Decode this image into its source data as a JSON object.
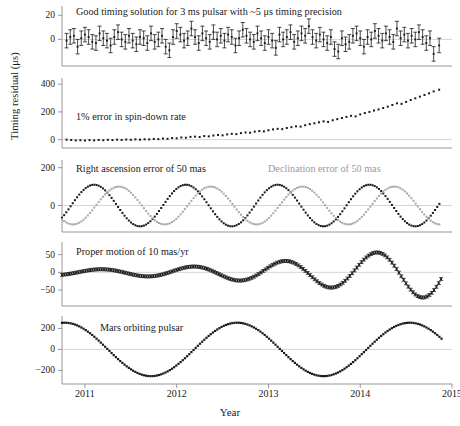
{
  "figure": {
    "ylabel": "Timing residual (μs)",
    "xlabel": "Year",
    "xticks": [
      "2011",
      "2012",
      "2013",
      "2014",
      "2015"
    ],
    "xlim": [
      2010.75,
      2015.0
    ],
    "series_color_black": "#1a1a1a",
    "series_color_gray": "#a8a8a8"
  },
  "chart_data": [
    {
      "type": "scatter",
      "panel": 1,
      "title": "Good timing solution for 3 ms pulsar with ~5 μs timing precision",
      "xlabel": "",
      "ylabel": "Timing residual (μs)",
      "yticks": [
        0,
        20
      ],
      "ylim": [
        -22,
        26
      ],
      "errorbars": true,
      "error": 6,
      "x": [
        2010.8,
        2010.84,
        2010.88,
        2010.92,
        2010.96,
        2011.0,
        2011.04,
        2011.08,
        2011.12,
        2011.16,
        2011.2,
        2011.24,
        2011.28,
        2011.32,
        2011.36,
        2011.4,
        2011.44,
        2011.48,
        2011.52,
        2011.56,
        2011.6,
        2011.64,
        2011.68,
        2011.72,
        2011.76,
        2011.8,
        2011.84,
        2011.88,
        2011.92,
        2011.96,
        2012.0,
        2012.04,
        2012.08,
        2012.12,
        2012.16,
        2012.2,
        2012.24,
        2012.28,
        2012.32,
        2012.36,
        2012.4,
        2012.44,
        2012.48,
        2012.52,
        2012.56,
        2012.6,
        2012.64,
        2012.68,
        2012.72,
        2012.76,
        2012.8,
        2012.84,
        2012.88,
        2012.92,
        2012.96,
        2013.0,
        2013.04,
        2013.08,
        2013.12,
        2013.16,
        2013.2,
        2013.24,
        2013.28,
        2013.32,
        2013.36,
        2013.4,
        2013.44,
        2013.48,
        2013.52,
        2013.56,
        2013.6,
        2013.64,
        2013.68,
        2013.72,
        2013.76,
        2013.8,
        2013.84,
        2013.88,
        2013.92,
        2013.96,
        2014.0,
        2014.04,
        2014.08,
        2014.12,
        2014.16,
        2014.2,
        2014.24,
        2014.28,
        2014.32,
        2014.36,
        2014.4,
        2014.44,
        2014.48,
        2014.52,
        2014.56,
        2014.6,
        2014.64,
        2014.68,
        2014.72,
        2014.76,
        2014.8,
        2014.86
      ],
      "values": [
        -1,
        2,
        3,
        -6,
        1,
        4,
        2,
        -2,
        -3,
        5,
        1,
        -1,
        -5,
        2,
        6,
        0,
        -2,
        3,
        -1,
        -4,
        2,
        1,
        -3,
        5,
        -2,
        0,
        3,
        -6,
        -9,
        2,
        7,
        4,
        -1,
        1,
        9,
        2,
        -3,
        5,
        1,
        -2,
        6,
        0,
        3,
        -1,
        4,
        2,
        -5,
        1,
        8,
        3,
        0,
        -2,
        5,
        1,
        -3,
        2,
        -1,
        -7,
        4,
        0,
        2,
        6,
        -2,
        1,
        5,
        3,
        11,
        2,
        -1,
        4,
        0,
        -3,
        2,
        -8,
        -10,
        1,
        -4,
        -2,
        3,
        5,
        1,
        -6,
        2,
        0,
        7,
        3,
        -1,
        5,
        2,
        -2,
        9,
        1,
        4,
        -1,
        3,
        0,
        6,
        2,
        -3,
        1,
        -12,
        -5
      ],
      "annotation_note": "residuals scatter about zero with ~5 microsecond error bars"
    },
    {
      "type": "scatter",
      "panel": 2,
      "title": "1% error in spin-down rate",
      "xlabel": "",
      "ylabel": "Timing residual (μs)",
      "yticks": [
        0,
        200,
        400
      ],
      "ylim": [
        -60,
        430
      ],
      "errorbars": false,
      "x": [
        2010.8,
        2010.85,
        2010.9,
        2010.95,
        2011.0,
        2011.05,
        2011.1,
        2011.15,
        2011.2,
        2011.25,
        2011.3,
        2011.35,
        2011.4,
        2011.45,
        2011.5,
        2011.55,
        2011.6,
        2011.65,
        2011.7,
        2011.75,
        2011.8,
        2011.85,
        2011.9,
        2011.95,
        2012.0,
        2012.05,
        2012.1,
        2012.15,
        2012.2,
        2012.25,
        2012.3,
        2012.35,
        2012.4,
        2012.45,
        2012.5,
        2012.55,
        2012.6,
        2012.65,
        2012.7,
        2012.75,
        2012.8,
        2012.85,
        2012.9,
        2012.95,
        2013.0,
        2013.05,
        2013.1,
        2013.15,
        2013.2,
        2013.25,
        2013.3,
        2013.35,
        2013.4,
        2013.45,
        2013.5,
        2013.55,
        2013.6,
        2013.65,
        2013.7,
        2013.75,
        2013.8,
        2013.85,
        2013.9,
        2013.95,
        2014.0,
        2014.05,
        2014.1,
        2014.15,
        2014.2,
        2014.25,
        2014.3,
        2014.35,
        2014.4,
        2014.45,
        2014.5,
        2014.55,
        2014.6,
        2014.65,
        2014.7,
        2014.75,
        2014.8,
        2014.86
      ],
      "values": [
        0,
        -2,
        -5,
        -4,
        -6,
        -3,
        -5,
        -2,
        -4,
        -1,
        -3,
        0,
        -2,
        1,
        -1,
        2,
        0,
        3,
        2,
        5,
        4,
        8,
        6,
        12,
        10,
        16,
        14,
        20,
        22,
        19,
        26,
        24,
        30,
        34,
        31,
        38,
        42,
        40,
        47,
        52,
        50,
        58,
        62,
        60,
        68,
        74,
        78,
        76,
        84,
        90,
        96,
        94,
        104,
        112,
        118,
        125,
        132,
        128,
        140,
        148,
        156,
        164,
        172,
        168,
        182,
        192,
        200,
        210,
        218,
        228,
        238,
        250,
        262,
        258,
        272,
        286,
        298,
        310,
        322,
        334,
        348,
        360
      ],
      "annotation_note": "quadratic growth from 0 to about 360 microseconds"
    },
    {
      "type": "scatter",
      "panel": 3,
      "title_black": "Right ascension error of 50 mas",
      "title_gray": "Declination error of 50 mas",
      "xlabel": "",
      "ylabel": "Timing residual (μs)",
      "yticks": [
        0,
        200
      ],
      "ylim": [
        -140,
        230
      ],
      "errorbars": false,
      "series": [
        {
          "name": "Right ascension error of 50 mas",
          "color": "#1a1a1a",
          "amplitude": 110,
          "period": 1.0,
          "phase_years": 0.0,
          "note": "sinusoid, peaks near 2011.1, 2012.1, 2013.1, 2014.1"
        },
        {
          "name": "Declination error of 50 mas",
          "color": "#a8a8a8",
          "amplitude": 100,
          "period": 1.0,
          "phase_years": 0.27,
          "note": "sinusoid lagging right ascension by about a quarter cycle"
        }
      ]
    },
    {
      "type": "scatter",
      "panel": 4,
      "title": "Proper motion of 10 mas/yr",
      "xlabel": "",
      "ylabel": "Timing residual (μs)",
      "yticks": [
        -50,
        0,
        50
      ],
      "ylim": [
        -95,
        80
      ],
      "errorbars": true,
      "error": 4,
      "series": [
        {
          "name": "Proper motion of 10 mas/yr",
          "color": "#1a1a1a",
          "period": 1.0,
          "amplitude_start": 8,
          "amplitude_end": 78,
          "note": "annual sinusoid with linearly growing amplitude"
        }
      ]
    },
    {
      "type": "scatter",
      "panel": 5,
      "title": "Mars orbiting pulsar",
      "xlabel": "Year",
      "ylabel": "Timing residual (μs)",
      "yticks": [
        -200,
        0,
        200
      ],
      "ylim": [
        -330,
        300
      ],
      "errorbars": false,
      "series": [
        {
          "name": "Mars orbiting pulsar",
          "color": "#1a1a1a",
          "amplitude": 255,
          "period": 1.88,
          "phase_years": 0.0,
          "note": "large sinusoid with Mars orbital period of 1.88 years"
        }
      ]
    }
  ]
}
